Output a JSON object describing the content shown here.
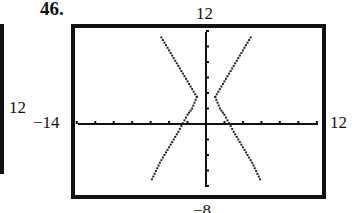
{
  "problem_number": "46.",
  "left_fragment_label": "12",
  "chart_data": {
    "type": "line",
    "title": "",
    "window": {
      "xmin": -14,
      "xmax": 12,
      "ymin": -8,
      "ymax": 12,
      "xscl": 2,
      "yscl": 2
    },
    "labels": {
      "xmin": "−14",
      "xmax": "12",
      "ymin": "−8",
      "ymax": "12"
    },
    "grid": false,
    "series": [
      {
        "name": "right branch",
        "points": [
          [
            1,
            3.5
          ],
          [
            1.5,
            2
          ],
          [
            2,
            1.2
          ],
          [
            3,
            -1
          ],
          [
            4,
            -3
          ],
          [
            5,
            -5
          ],
          [
            6,
            -7.5
          ]
        ],
        "upper_points": [
          [
            1,
            3.5
          ],
          [
            2,
            5.5
          ],
          [
            3,
            7.5
          ],
          [
            4,
            9.5
          ],
          [
            5,
            11.5
          ]
        ]
      },
      {
        "name": "left branch",
        "points": [
          [
            -1,
            3.5
          ],
          [
            -1.5,
            2
          ],
          [
            -2,
            1.2
          ],
          [
            -3,
            -1
          ],
          [
            -4,
            -3
          ],
          [
            -5,
            -5
          ],
          [
            -6,
            -7.5
          ]
        ],
        "upper_points": [
          [
            -1,
            3.5
          ],
          [
            -2,
            5.5
          ],
          [
            -3,
            7.5
          ],
          [
            -4,
            9.5
          ],
          [
            -5,
            11.5
          ]
        ]
      }
    ]
  }
}
